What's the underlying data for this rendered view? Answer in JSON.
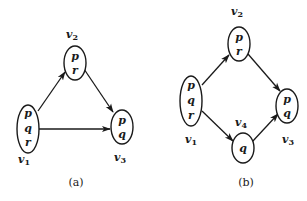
{
  "figures": [
    {
      "id": "a",
      "caption": "(a)",
      "nodes": [
        {
          "name": "v1",
          "label_base": "v",
          "label_sub": "1",
          "vars": [
            "p",
            "q",
            "r"
          ]
        },
        {
          "name": "v2",
          "label_base": "v",
          "label_sub": "2",
          "vars": [
            "p",
            "r"
          ]
        },
        {
          "name": "v3",
          "label_base": "v",
          "label_sub": "3",
          "vars": [
            "p",
            "q"
          ]
        }
      ],
      "edges": [
        {
          "from": "v1",
          "to": "v2"
        },
        {
          "from": "v2",
          "to": "v3"
        },
        {
          "from": "v1",
          "to": "v3"
        }
      ]
    },
    {
      "id": "b",
      "caption": "(b)",
      "nodes": [
        {
          "name": "v1",
          "label_base": "v",
          "label_sub": "1",
          "vars": [
            "p",
            "q",
            "r"
          ]
        },
        {
          "name": "v2",
          "label_base": "v",
          "label_sub": "2",
          "vars": [
            "p",
            "r"
          ]
        },
        {
          "name": "v3",
          "label_base": "v",
          "label_sub": "3",
          "vars": [
            "p",
            "q"
          ]
        },
        {
          "name": "v4",
          "label_base": "v",
          "label_sub": "4",
          "vars": [
            "q"
          ]
        }
      ],
      "edges": [
        {
          "from": "v1",
          "to": "v2"
        },
        {
          "from": "v2",
          "to": "v3"
        },
        {
          "from": "v1",
          "to": "v4"
        },
        {
          "from": "v4",
          "to": "v3"
        }
      ]
    }
  ],
  "colors": {
    "stroke": "#1a1a1a",
    "background": "#ffffff"
  }
}
